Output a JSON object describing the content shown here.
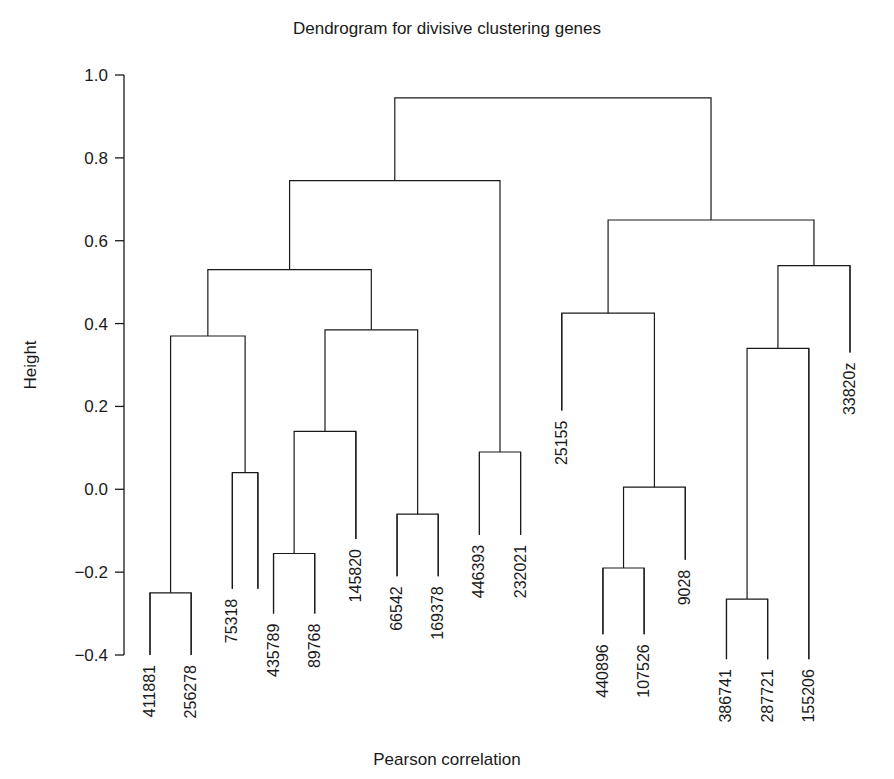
{
  "chart_data": {
    "type": "dendrogram",
    "title": "Dendrogram for divisive clustering genes",
    "xlabel": "Pearson correlation",
    "ylabel": "Height",
    "ylim": [
      -0.42,
      1.02
    ],
    "grid": false,
    "legend": null,
    "y_ticks": [
      {
        "value": 1.0,
        "label": "1.0"
      },
      {
        "value": 0.8,
        "label": "0.8"
      },
      {
        "value": 0.6,
        "label": "0.6"
      },
      {
        "value": 0.4,
        "label": "0.4"
      },
      {
        "value": 0.2,
        "label": "0.2"
      },
      {
        "value": 0.0,
        "label": "0.0"
      },
      {
        "value": -0.2,
        "label": "−0.2"
      },
      {
        "value": -0.4,
        "label": "−0.4"
      }
    ],
    "leaves": [
      {
        "label": "411881",
        "pos": 0,
        "height": -0.4
      },
      {
        "label": "256278",
        "pos": 1,
        "height": -0.4
      },
      {
        "label": "75318",
        "pos": 2,
        "height": -0.24
      },
      {
        "label": "435789",
        "pos": 3,
        "height": -0.3
      },
      {
        "label": "89768",
        "pos": 4,
        "height": -0.3
      },
      {
        "label": "145820",
        "pos": 5,
        "height": -0.12
      },
      {
        "label": "66542",
        "pos": 6,
        "height": -0.21
      },
      {
        "label": "169378",
        "pos": 7,
        "height": -0.21
      },
      {
        "label": "446393",
        "pos": 8,
        "height": -0.11
      },
      {
        "label": "232021",
        "pos": 9,
        "height": -0.11
      },
      {
        "label": "25155",
        "pos": 10,
        "height": 0.19
      },
      {
        "label": "440896",
        "pos": 11,
        "height": -0.35
      },
      {
        "label": "107526",
        "pos": 12,
        "height": -0.35
      },
      {
        "label": "9028",
        "pos": 13,
        "height": -0.17
      },
      {
        "label": "386741",
        "pos": 14,
        "height": -0.41
      },
      {
        "label": "287721",
        "pos": 15,
        "height": -0.41
      },
      {
        "label": "155206",
        "pos": 16,
        "height": -0.41
      },
      {
        "label": "33820z",
        "pos": 17,
        "height": 0.33
      }
    ],
    "merges": [
      {
        "id": "n1",
        "height": -0.25,
        "left": "411881",
        "right": "256278"
      },
      {
        "id": "n2",
        "height": 0.04,
        "left": "75318",
        "right": "75318b"
      },
      {
        "id": "n3",
        "height": 0.37,
        "left": "n1",
        "right": "n2"
      },
      {
        "id": "n4",
        "height": -0.155,
        "left": "435789",
        "right": "89768"
      },
      {
        "id": "n5",
        "height": 0.14,
        "left": "n4",
        "right": "145820"
      },
      {
        "id": "n6",
        "height": -0.06,
        "left": "66542",
        "right": "169378"
      },
      {
        "id": "n7",
        "height": 0.385,
        "left": "n5",
        "right": "n6"
      },
      {
        "id": "n8",
        "height": 0.53,
        "left": "n3",
        "right": "n7"
      },
      {
        "id": "n9",
        "height": 0.09,
        "left": "446393",
        "right": "232021"
      },
      {
        "id": "n10",
        "height": 0.745,
        "left": "n8",
        "right": "n9"
      },
      {
        "id": "n11",
        "height": -0.19,
        "left": "440896",
        "right": "107526"
      },
      {
        "id": "n12",
        "height": 0.005,
        "left": "n11",
        "right": "9028"
      },
      {
        "id": "n13",
        "height": 0.425,
        "left": "25155",
        "right": "n12"
      },
      {
        "id": "n14",
        "height": -0.265,
        "left": "386741",
        "right": "287721"
      },
      {
        "id": "n15",
        "height": 0.34,
        "left": "n14",
        "right": "155206"
      },
      {
        "id": "n16",
        "height": 0.54,
        "left": "n15",
        "right": "33820z"
      },
      {
        "id": "n17",
        "height": 0.65,
        "left": "n13",
        "right": "n16"
      },
      {
        "id": "n18",
        "height": 0.945,
        "left": "n10",
        "right": "n17"
      }
    ],
    "root": "n18",
    "axis": {
      "x_left_px": 124,
      "y_top_px": 75,
      "y_bottom_px": 655,
      "plot_left_px": 150,
      "plot_right_px": 850
    },
    "colors": {
      "line": "#1a1a1a",
      "text": "#1a1a1a",
      "background": "#ffffff"
    }
  }
}
